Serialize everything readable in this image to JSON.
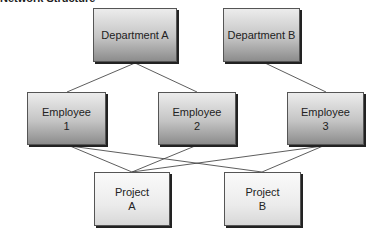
{
  "title": "Network Structure",
  "departments": [
    {
      "id": "dept-a",
      "label": "Department A"
    },
    {
      "id": "dept-b",
      "label": "Department B"
    }
  ],
  "employees": [
    {
      "id": "emp-1",
      "line1": "Employee",
      "line2": "1"
    },
    {
      "id": "emp-2",
      "line1": "Employee",
      "line2": "2"
    },
    {
      "id": "emp-3",
      "line1": "Employee",
      "line2": "3"
    }
  ],
  "projects": [
    {
      "id": "proj-a",
      "line1": "Project",
      "line2": "A"
    },
    {
      "id": "proj-b",
      "line1": "Project",
      "line2": "B"
    }
  ],
  "edges": [
    {
      "from": "Department A",
      "to": "Employee 1"
    },
    {
      "from": "Department A",
      "to": "Employee 2"
    },
    {
      "from": "Department B",
      "to": "Employee 3"
    },
    {
      "from": "Employee 1",
      "to": "Project A"
    },
    {
      "from": "Employee 1",
      "to": "Project B"
    },
    {
      "from": "Employee 2",
      "to": "Project A"
    },
    {
      "from": "Employee 3",
      "to": "Project A"
    },
    {
      "from": "Employee 3",
      "to": "Project B"
    }
  ],
  "colors": {
    "line": "#333333",
    "border": "#555555",
    "shadow": "#222222"
  }
}
